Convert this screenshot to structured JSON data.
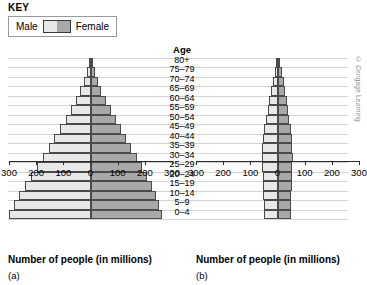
{
  "key": {
    "title": "KEY",
    "male_label": "Male",
    "female_label": "Female",
    "male_color": "#e8e8e8",
    "female_color": "#a8a8a8"
  },
  "age_heading": "Age",
  "credit": "© Cengage Learning",
  "chart_data": [
    {
      "type": "bar",
      "orientation": "population-pyramid",
      "panel": "(a)",
      "title": "",
      "xlabel": "Number of people (in millions)",
      "ylabel": "Age",
      "xlim": [
        -300,
        300
      ],
      "xticks": [
        300,
        200,
        100,
        0,
        100,
        200,
        300
      ],
      "grid": true,
      "legend_position": "top-left",
      "categories": [
        "80+",
        "75–79",
        "70–74",
        "65–69",
        "60–64",
        "55–59",
        "50–54",
        "45–49",
        "40–44",
        "35–39",
        "30–34",
        "25–29",
        "20–24",
        "15–19",
        "10–14",
        "5–9",
        "0–4"
      ],
      "series": [
        {
          "name": "Male",
          "values": [
            6,
            14,
            24,
            38,
            54,
            72,
            92,
            112,
            133,
            154,
            176,
            198,
            220,
            243,
            263,
            282,
            300
          ]
        },
        {
          "name": "Female",
          "values": [
            8,
            16,
            26,
            40,
            56,
            74,
            93,
            112,
            131,
            150,
            170,
            190,
            208,
            226,
            240,
            252,
            262
          ]
        }
      ]
    },
    {
      "type": "bar",
      "orientation": "population-pyramid",
      "panel": "(b)",
      "title": "",
      "xlabel": "Number of people (in millions)",
      "ylabel": "Age",
      "xlim": [
        -300,
        300
      ],
      "xticks": [
        300,
        200,
        100,
        0,
        100,
        200,
        300
      ],
      "grid": true,
      "legend_position": "top-left",
      "categories": [
        "80+",
        "75–79",
        "70–74",
        "65–69",
        "60–64",
        "55–59",
        "50–54",
        "45–49",
        "40–44",
        "35–39",
        "30–34",
        "25–29",
        "20–24",
        "15–19",
        "10–14",
        "5–9",
        "0–4"
      ],
      "series": [
        {
          "name": "Male",
          "values": [
            4,
            10,
            17,
            24,
            30,
            36,
            42,
            48,
            54,
            56,
            57,
            56,
            55,
            54,
            52,
            51,
            50
          ]
        },
        {
          "name": "Female",
          "values": [
            9,
            16,
            23,
            29,
            34,
            39,
            44,
            49,
            53,
            55,
            56,
            55,
            54,
            52,
            51,
            50,
            49
          ]
        }
      ]
    }
  ],
  "axis_a": {
    "tick_labels": [
      "300",
      "200",
      "100",
      "0",
      "100",
      "200",
      "300"
    ],
    "title": "Number of people (in millions)",
    "panel_tag": "(a)"
  },
  "axis_b": {
    "tick_labels": [
      "300",
      "200",
      "100",
      "0",
      "100",
      "200",
      "300"
    ],
    "title": "Number of people (in millions)",
    "panel_tag": "(b)"
  }
}
